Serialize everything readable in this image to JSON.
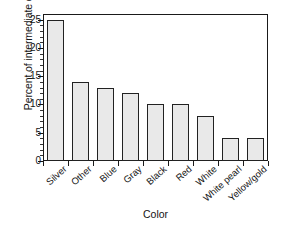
{
  "chart_data": {
    "type": "bar",
    "title": "",
    "xlabel": "Color",
    "ylabel": "Percent of intermediate cars",
    "categories": [
      "Silver",
      "Other",
      "Blue",
      "Gray",
      "Black",
      "Red",
      "White",
      "White pearl",
      "Yellow/gold"
    ],
    "values": [
      25,
      14,
      13,
      12,
      10,
      10,
      8,
      4,
      4
    ],
    "ylim": [
      0,
      26
    ],
    "yticks": [
      0,
      5,
      10,
      15,
      20,
      25
    ],
    "ytick_labels": [
      "0",
      "5",
      "10",
      "15",
      "20",
      "25"
    ],
    "yminor_step": 1,
    "grid": false,
    "legend": false,
    "bar_fill_color": "#e9e9e9",
    "bar_edge_color": "#222222",
    "axis_color": "#1a1a1a",
    "background_color": "#ffffff"
  }
}
